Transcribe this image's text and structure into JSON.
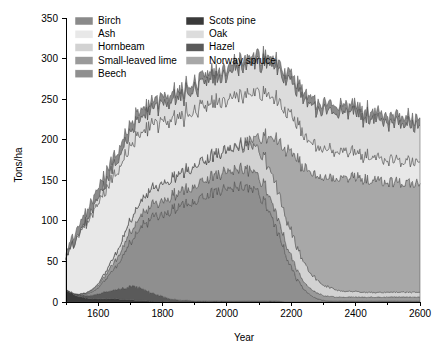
{
  "chart_data": {
    "type": "area",
    "stacked": true,
    "title": "",
    "xlabel": "Year",
    "ylabel": "Tons/ha",
    "xlim": [
      1500,
      2600
    ],
    "ylim": [
      0,
      350
    ],
    "xticks": [
      1600,
      1800,
      2000,
      2200,
      2400,
      2600
    ],
    "xtick_labels": [
      "1600",
      "1800",
      "2000",
      "2200",
      "2400",
      "2600"
    ],
    "yticks": [
      0,
      50,
      100,
      150,
      200,
      250,
      300,
      350
    ],
    "ytick_labels": [
      "0",
      "50",
      "100",
      "150",
      "200",
      "250",
      "300",
      "350"
    ],
    "grid": false,
    "legend_position": "upper-left-inside",
    "legend_columns": 2,
    "x": [
      1500,
      1520,
      1540,
      1560,
      1580,
      1600,
      1620,
      1640,
      1660,
      1680,
      1700,
      1720,
      1740,
      1760,
      1780,
      1800,
      1820,
      1840,
      1860,
      1880,
      1900,
      1920,
      1940,
      1960,
      1980,
      2000,
      2020,
      2040,
      2060,
      2080,
      2100,
      2120,
      2140,
      2160,
      2180,
      2200,
      2220,
      2240,
      2260,
      2280,
      2300,
      2320,
      2340,
      2360,
      2380,
      2400,
      2420,
      2440,
      2460,
      2480,
      2500,
      2520,
      2540,
      2560,
      2580,
      2600
    ],
    "series": [
      {
        "name": "Scots pine",
        "color": "#3a3a3a",
        "values": [
          14,
          10,
          7,
          5,
          4,
          4,
          4,
          4,
          4,
          3,
          3,
          2,
          2,
          1,
          1,
          1,
          0,
          0,
          0,
          0,
          0,
          0,
          0,
          0,
          0,
          0,
          0,
          0,
          0,
          0,
          0,
          0,
          0,
          0,
          0,
          0,
          0,
          0,
          0,
          0,
          0,
          0,
          0,
          0,
          0,
          0,
          0,
          0,
          0,
          0,
          0,
          0,
          0,
          0,
          0,
          0
        ]
      },
      {
        "name": "Hazel",
        "color": "#5a5a5a",
        "values": [
          1,
          1,
          2,
          3,
          4,
          6,
          8,
          10,
          12,
          14,
          16,
          16,
          14,
          11,
          8,
          6,
          4,
          3,
          2,
          2,
          1,
          1,
          1,
          1,
          1,
          1,
          1,
          1,
          1,
          1,
          1,
          1,
          1,
          1,
          0,
          0,
          0,
          0,
          0,
          0,
          0,
          0,
          0,
          0,
          0,
          0,
          0,
          0,
          0,
          0,
          0,
          0,
          0,
          0,
          0,
          0
        ]
      },
      {
        "name": "Beech",
        "color": "#8f8f8f",
        "values": [
          0,
          0,
          1,
          2,
          4,
          8,
          14,
          22,
          32,
          44,
          56,
          68,
          79,
          88,
          96,
          102,
          108,
          112,
          116,
          120,
          124,
          128,
          131,
          134,
          137,
          139,
          141,
          142,
          141,
          138,
          132,
          120,
          104,
          84,
          62,
          42,
          26,
          15,
          8,
          4,
          2,
          1,
          1,
          1,
          1,
          1,
          1,
          1,
          1,
          1,
          1,
          1,
          1,
          1,
          1,
          1
        ]
      },
      {
        "name": "Small-leaved lime",
        "color": "#9a9a9a",
        "values": [
          0,
          0,
          0,
          1,
          2,
          3,
          5,
          7,
          9,
          11,
          13,
          14,
          15,
          16,
          16,
          17,
          17,
          18,
          18,
          18,
          19,
          19,
          20,
          20,
          21,
          21,
          21,
          22,
          22,
          22,
          21,
          20,
          19,
          17,
          15,
          13,
          11,
          9,
          8,
          7,
          6,
          6,
          5,
          5,
          5,
          5,
          5,
          5,
          5,
          5,
          5,
          5,
          5,
          5,
          5,
          5
        ]
      },
      {
        "name": "Hornbeam",
        "color": "#d2d2d2",
        "values": [
          0,
          0,
          0,
          0,
          1,
          2,
          4,
          6,
          9,
          12,
          15,
          17,
          19,
          20,
          21,
          22,
          22,
          23,
          23,
          24,
          24,
          25,
          25,
          26,
          26,
          27,
          28,
          29,
          30,
          31,
          32,
          33,
          34,
          34,
          33,
          31,
          28,
          24,
          20,
          16,
          13,
          11,
          9,
          8,
          7,
          7,
          6,
          6,
          6,
          6,
          6,
          6,
          6,
          6,
          6,
          6
        ]
      },
      {
        "name": "Norway spruce",
        "color": "#a8a8a8",
        "values": [
          0,
          0,
          0,
          0,
          0,
          0,
          0,
          0,
          0,
          0,
          0,
          0,
          0,
          0,
          0,
          0,
          0,
          0,
          0,
          0,
          0,
          0,
          0,
          0,
          0,
          0,
          1,
          2,
          4,
          8,
          16,
          28,
          44,
          62,
          80,
          96,
          108,
          117,
          124,
          129,
          133,
          136,
          138,
          140,
          141,
          141,
          140,
          139,
          138,
          137,
          136,
          136,
          135,
          135,
          134,
          134
        ]
      },
      {
        "name": "Ash",
        "color": "#e8e8e8",
        "values": [
          40,
          58,
          72,
          84,
          92,
          98,
          100,
          100,
          98,
          95,
          91,
          87,
          83,
          80,
          77,
          75,
          73,
          71,
          70,
          68,
          67,
          66,
          65,
          64,
          63,
          62,
          61,
          60,
          58,
          56,
          54,
          52,
          50,
          48,
          46,
          44,
          42,
          40,
          38,
          36,
          35,
          34,
          33,
          32,
          31,
          30,
          30,
          29,
          29,
          28,
          28,
          28,
          27,
          27,
          27,
          27
        ]
      },
      {
        "name": "Oak",
        "color": "#dcdcdc",
        "values": [
          0,
          1,
          2,
          3,
          5,
          7,
          9,
          11,
          13,
          15,
          17,
          18,
          19,
          20,
          21,
          22,
          23,
          24,
          25,
          26,
          27,
          28,
          29,
          30,
          31,
          32,
          33,
          34,
          35,
          36,
          37,
          38,
          39,
          40,
          41,
          42,
          43,
          44,
          45,
          46,
          47,
          48,
          48,
          49,
          49,
          49,
          48,
          48,
          47,
          47,
          46,
          46,
          46,
          45,
          45,
          45
        ]
      },
      {
        "name": "Birch",
        "color": "#8a8a8a",
        "values": [
          6,
          8,
          10,
          11,
          12,
          12,
          12,
          12,
          11,
          11,
          10,
          10,
          10,
          9,
          9,
          9,
          9,
          9,
          9,
          9,
          9,
          9,
          9,
          9,
          9,
          9,
          9,
          9,
          9,
          9,
          9,
          9,
          9,
          9,
          9,
          9,
          9,
          9,
          9,
          9,
          9,
          9,
          9,
          9,
          9,
          9,
          9,
          9,
          9,
          9,
          9,
          9,
          9,
          9,
          9,
          9
        ]
      }
    ],
    "legend_order": [
      "Birch",
      "Ash",
      "Hornbeam",
      "Small-leaved lime",
      "Beech",
      "Scots pine",
      "Oak",
      "Hazel",
      "Norway spruce"
    ],
    "legend_colors": {
      "Birch": "#8a8a8a",
      "Ash": "#e8e8e8",
      "Hornbeam": "#d2d2d2",
      "Small-leaved lime": "#9a9a9a",
      "Beech": "#8f8f8f",
      "Scots pine": "#3a3a3a",
      "Oak": "#dcdcdc",
      "Hazel": "#5a5a5a",
      "Norway spruce": "#a8a8a8"
    }
  }
}
